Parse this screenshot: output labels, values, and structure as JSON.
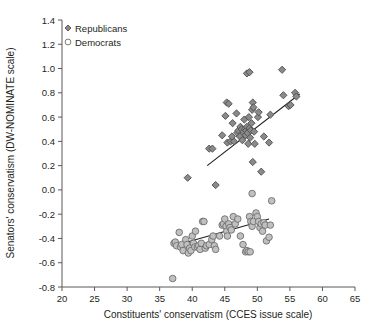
{
  "chart_data": {
    "type": "scatter",
    "title": "",
    "xlabel": "Constituents' conservatism (CCES issue scale)",
    "ylabel": "Senators' conservatism (DW-NOMINATE scale)",
    "xlim": [
      20,
      65
    ],
    "ylim": [
      -0.8,
      1.4
    ],
    "xticks": [
      20,
      25,
      30,
      35,
      40,
      45,
      50,
      55,
      60,
      65
    ],
    "xtick_labels": [
      "20",
      "25",
      "30",
      "35",
      "40",
      "45",
      "50",
      "55",
      "60",
      "65"
    ],
    "yticks": [
      -0.8,
      -0.6,
      -0.4,
      -0.2,
      0.0,
      0.2,
      0.4,
      0.6,
      0.8,
      1.0,
      1.2,
      1.4
    ],
    "ytick_labels": [
      "-0.8",
      "-0.6",
      "-0.4",
      "-0.2",
      "0.0",
      "0.2",
      "0.4",
      "0.6",
      "0.8",
      "1.0",
      "1.2",
      "1.4"
    ],
    "grid": false,
    "legend_position": "top-left",
    "legend": [
      {
        "name": "Republicans",
        "marker": "diamond",
        "fill": "#8a8a8a",
        "stroke": "#4d4d4d"
      },
      {
        "name": "Democrats",
        "marker": "circle",
        "fill": "#c0c0c0",
        "stroke": "#6e6e6e"
      }
    ],
    "series": [
      {
        "name": "Republicans",
        "marker": "diamond",
        "fill": "#8a8a8a",
        "stroke": "#4d4d4d",
        "points": [
          [
            39.3,
            0.1
          ],
          [
            43.6,
            0.04
          ],
          [
            42.6,
            0.34
          ],
          [
            43.1,
            0.34
          ],
          [
            44.6,
            0.45
          ],
          [
            45.1,
            0.61
          ],
          [
            45.3,
            0.72
          ],
          [
            45.6,
            0.71
          ],
          [
            45.4,
            0.39
          ],
          [
            45.9,
            0.4
          ],
          [
            46.2,
            0.55
          ],
          [
            46.4,
            0.4
          ],
          [
            46.1,
            0.44
          ],
          [
            46.8,
            0.63
          ],
          [
            46.9,
            0.47
          ],
          [
            47.1,
            0.49
          ],
          [
            47.3,
            0.44
          ],
          [
            47.4,
            0.52
          ],
          [
            47.6,
            0.5
          ],
          [
            47.7,
            0.41
          ],
          [
            47.9,
            0.48
          ],
          [
            48.0,
            0.58
          ],
          [
            48.1,
            0.5
          ],
          [
            48.2,
            0.45
          ],
          [
            48.3,
            0.49
          ],
          [
            48.4,
            0.52
          ],
          [
            48.5,
            0.47
          ],
          [
            48.6,
            0.38
          ],
          [
            48.4,
            0.96
          ],
          [
            48.8,
            0.97
          ],
          [
            48.7,
            0.6
          ],
          [
            48.8,
            0.51
          ],
          [
            48.9,
            0.43
          ],
          [
            49.0,
            0.49
          ],
          [
            49.1,
            0.55
          ],
          [
            49.2,
            0.66
          ],
          [
            49.3,
            0.72
          ],
          [
            49.4,
            0.68
          ],
          [
            49.5,
            0.48
          ],
          [
            49.6,
            0.38
          ],
          [
            49.3,
            0.23
          ],
          [
            50.1,
            0.6
          ],
          [
            50.2,
            0.64
          ],
          [
            50.6,
            0.15
          ],
          [
            51.0,
            0.44
          ],
          [
            51.8,
            0.39
          ],
          [
            52.0,
            0.62
          ],
          [
            53.8,
            0.99
          ],
          [
            54.0,
            0.78
          ],
          [
            54.8,
            0.69
          ],
          [
            55.1,
            0.7
          ],
          [
            55.8,
            0.8
          ],
          [
            56.0,
            0.77
          ]
        ],
        "fit_line": {
          "x0": 42.3,
          "y0": 0.2,
          "x1": 56.5,
          "y1": 0.79
        }
      },
      {
        "name": "Democrats",
        "marker": "circle",
        "fill": "#c0c0c0",
        "stroke": "#6e6e6e",
        "points": [
          [
            37.0,
            -0.73
          ],
          [
            37.2,
            -0.44
          ],
          [
            37.4,
            -0.43
          ],
          [
            37.6,
            -0.46
          ],
          [
            38.0,
            -0.35
          ],
          [
            38.2,
            -0.47
          ],
          [
            38.4,
            -0.45
          ],
          [
            38.6,
            -0.5
          ],
          [
            39.0,
            -0.41
          ],
          [
            39.2,
            -0.45
          ],
          [
            39.4,
            -0.52
          ],
          [
            39.6,
            -0.48
          ],
          [
            39.8,
            -0.5
          ],
          [
            40.0,
            -0.38
          ],
          [
            40.2,
            -0.44
          ],
          [
            40.4,
            -0.47
          ],
          [
            40.5,
            -0.34
          ],
          [
            40.8,
            -0.47
          ],
          [
            41.0,
            -0.46
          ],
          [
            41.2,
            -0.49
          ],
          [
            41.4,
            -0.44
          ],
          [
            41.6,
            -0.26
          ],
          [
            41.8,
            -0.26
          ],
          [
            42.0,
            -0.48
          ],
          [
            42.2,
            -0.46
          ],
          [
            42.6,
            -0.45
          ],
          [
            43.0,
            -0.41
          ],
          [
            43.2,
            -0.38
          ],
          [
            43.4,
            -0.46
          ],
          [
            43.6,
            -0.49
          ],
          [
            44.2,
            -0.38
          ],
          [
            44.6,
            -0.29
          ],
          [
            44.8,
            -0.28
          ],
          [
            45.0,
            -0.24
          ],
          [
            45.2,
            -0.3
          ],
          [
            45.3,
            -0.34
          ],
          [
            45.4,
            -0.38
          ],
          [
            45.6,
            -0.28
          ],
          [
            45.8,
            -0.31
          ],
          [
            46.0,
            -0.33
          ],
          [
            46.3,
            -0.22
          ],
          [
            46.6,
            -0.28
          ],
          [
            47.0,
            -0.24
          ],
          [
            47.4,
            -0.38
          ],
          [
            47.8,
            -0.45
          ],
          [
            48.2,
            -0.51
          ],
          [
            48.4,
            -0.5
          ],
          [
            48.8,
            -0.22
          ],
          [
            49.0,
            -0.26
          ],
          [
            49.2,
            -0.3
          ],
          [
            49.4,
            -0.26
          ],
          [
            49.2,
            -0.03
          ],
          [
            49.8,
            -0.19
          ],
          [
            50.0,
            -0.22
          ],
          [
            50.2,
            -0.26
          ],
          [
            50.4,
            -0.31
          ],
          [
            50.6,
            -0.28
          ],
          [
            50.8,
            -0.34
          ],
          [
            51.0,
            -0.27
          ],
          [
            51.2,
            -0.29
          ],
          [
            51.4,
            -0.42
          ],
          [
            51.8,
            -0.39
          ],
          [
            52.0,
            -0.29
          ],
          [
            52.2,
            -0.09
          ],
          [
            48.6,
            -0.51
          ],
          [
            48.9,
            -0.51
          ]
        ],
        "fit_line": {
          "x0": 37.2,
          "y0": -0.46,
          "x1": 51.8,
          "y1": -0.24
        }
      }
    ]
  }
}
